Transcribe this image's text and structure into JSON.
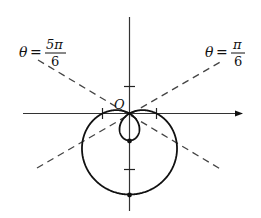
{
  "diagram": {
    "type": "polar-curve",
    "curve": "limacon with inner loop (r = 1 - 2 sin θ)",
    "origin_label": "O",
    "left_line": {
      "theta_symbol": "θ",
      "equals": "=",
      "numerator": "5π",
      "denominator": "6"
    },
    "right_line": {
      "theta_symbol": "θ",
      "equals": "=",
      "numerator": "π",
      "denominator": "6"
    },
    "colors": {
      "stroke": "#111111",
      "axis": "#333333",
      "dashed": "#444444",
      "background": "#ffffff"
    }
  }
}
